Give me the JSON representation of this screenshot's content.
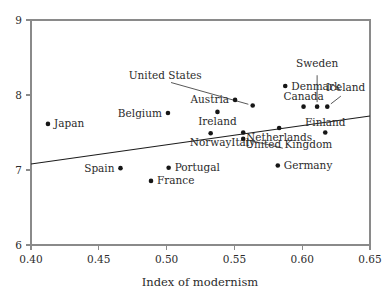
{
  "chart_data": {
    "type": "scatter",
    "title": "",
    "xlabel": "Index of modernism",
    "ylabel": "",
    "xlim": [
      0.4,
      0.65
    ],
    "ylim": [
      6,
      9
    ],
    "xticks": [
      0.4,
      0.45,
      0.5,
      0.55,
      0.6,
      0.65
    ],
    "xtick_labels": [
      "0.40",
      "0.45",
      "0.50",
      "0.55",
      "0.60",
      "0.65"
    ],
    "yticks": [
      6,
      7,
      8,
      9
    ],
    "ytick_labels": [
      "6",
      "7",
      "8",
      "9"
    ],
    "grid": false,
    "legend": "none",
    "points": [
      {
        "label": "Japan",
        "x": 0.4125,
        "y": 7.615,
        "label_side": "right"
      },
      {
        "label": "Belgium",
        "x": 0.501,
        "y": 7.76,
        "label_side": "left"
      },
      {
        "label": "Austria",
        "x": 0.5505,
        "y": 7.935,
        "label_side": "left"
      },
      {
        "label": "Ireland",
        "x": 0.5375,
        "y": 7.775,
        "label_side": "below"
      },
      {
        "label": "United States",
        "x": 0.5635,
        "y": 7.86,
        "label_side": "leader",
        "leader_label_x": 0.499,
        "leader_label_y": 8.215
      },
      {
        "label": "Denmark",
        "x": 0.5875,
        "y": 8.12,
        "label_side": "right"
      },
      {
        "label": "Canada",
        "x": 0.601,
        "y": 7.845,
        "label_side": "above"
      },
      {
        "label": "Sweden",
        "x": 0.611,
        "y": 7.845,
        "label_side": "leader",
        "leader_label_x": 0.611,
        "leader_label_y": 8.37
      },
      {
        "label": "Iceland",
        "x": 0.6185,
        "y": 7.845,
        "label_side": "leader",
        "leader_label_x": 0.632,
        "leader_label_y": 8.06
      },
      {
        "label": "Finland",
        "x": 0.617,
        "y": 7.5,
        "label_side": "above"
      },
      {
        "label": "Netherlands",
        "x": 0.583,
        "y": 7.56,
        "label_side": "below"
      },
      {
        "label": "Norway",
        "x": 0.5325,
        "y": 7.49,
        "label_side": "below"
      },
      {
        "label": "Italy",
        "x": 0.5565,
        "y": 7.5,
        "label_side": "below"
      },
      {
        "label": "United Kingdom",
        "x": 0.5565,
        "y": 7.415,
        "label_side": "leader",
        "leader_label_x": 0.59,
        "leader_label_y": 7.3
      },
      {
        "label": "Germany",
        "x": 0.582,
        "y": 7.06,
        "label_side": "right"
      },
      {
        "label": "Spain",
        "x": 0.466,
        "y": 7.025,
        "label_side": "left"
      },
      {
        "label": "Portugal",
        "x": 0.5015,
        "y": 7.03,
        "label_side": "right"
      },
      {
        "label": "France",
        "x": 0.4885,
        "y": 6.855,
        "label_side": "right"
      }
    ],
    "fit_line": {
      "x_start": 0.4,
      "y_start": 7.08,
      "x_end": 0.65,
      "y_end": 7.72
    }
  }
}
